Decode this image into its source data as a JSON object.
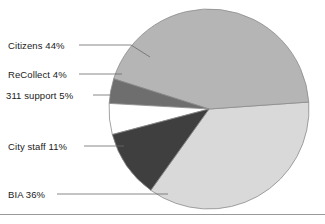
{
  "chart_data": {
    "type": "pie",
    "title": "",
    "subtitle": "",
    "xlabel": "",
    "ylabel": "",
    "legend_position": "callout-labels-left",
    "grid": false,
    "labels": [
      "Citizens",
      "ReCollect",
      "311 support",
      "City staff",
      "BIA"
    ],
    "values": [
      44,
      4,
      5,
      11,
      36
    ],
    "value_unit": "%",
    "slices": [
      {
        "label": "Citizens",
        "value": 44,
        "display": "Citizens 44%",
        "color": "#b5b5b5",
        "start_angle": -4,
        "end_angle": -162.4
      },
      {
        "label": "ReCollect",
        "value": 4,
        "display": "ReCollect 4%",
        "color": "#6e6e6e",
        "start_angle": -162.4,
        "end_angle": -176.8
      },
      {
        "label": "311 support",
        "value": 5,
        "display": "311 support 5%",
        "color": "#ffffff",
        "start_angle": -176.8,
        "end_angle": -194.8
      },
      {
        "label": "City staff",
        "value": 11,
        "display": "City staff 11%",
        "color": "#3f3f3f",
        "start_angle": -194.8,
        "end_angle": -234.4
      },
      {
        "label": "BIA",
        "value": 36,
        "display": "BIA 36%",
        "color": "#d9d9d9",
        "start_angle": -234.4,
        "end_angle": -364
      }
    ]
  },
  "callouts": {
    "citizens": "Citizens 44%",
    "recollect": "ReCollect 4%",
    "support311": "311 support 5%",
    "citystaff": "City staff 11%",
    "bia": "BIA 36%"
  },
  "colors": {
    "citizens": "#b5b5b5",
    "recollect": "#6e6e6e",
    "support311": "#ffffff",
    "citystaff": "#3f3f3f",
    "bia": "#d9d9d9",
    "outline": "#8c8c8c",
    "leader_line": "#6b6b6b",
    "rule": "#9a9a9a",
    "text": "#1a1a1a",
    "background": "#ffffff"
  }
}
